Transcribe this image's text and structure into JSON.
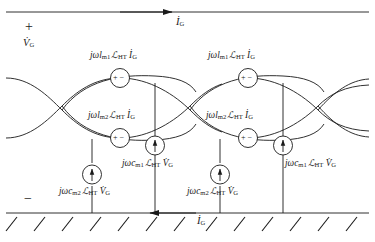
{
  "diagram": {
    "type": "circuit-schematic",
    "line_color": "#1a1a1a",
    "background": "#ffffff"
  },
  "terminals": {
    "plus_sign": "+",
    "minus_sign": "−",
    "port_voltage": "V̇",
    "port_voltage_sub": "G"
  },
  "rails": {
    "top_current_label": "İ",
    "top_current_sub": "G",
    "top_arrow_direction": "right",
    "bottom_current_label": "İ",
    "bottom_current_sub": "G",
    "bottom_arrow_direction": "left",
    "ground_hatch_count": 13
  },
  "sources": [
    {
      "id": "vsrc-l-m1-left",
      "kind": "voltage-source",
      "polarity": "+ −",
      "prefix": "jωl",
      "sub": "m1",
      "script": "ℒ",
      "script_sub": "HT",
      "quantity": "İ",
      "quantity_sub": "G",
      "label": "jωl m1 ℒ HT İ G"
    },
    {
      "id": "vsrc-l-m2-left",
      "kind": "voltage-source",
      "polarity": "+ −",
      "prefix": "jωl",
      "sub": "m2",
      "script": "ℒ",
      "script_sub": "HT",
      "quantity": "İ",
      "quantity_sub": "G",
      "label": "jωl m2 ℒ HT İ G"
    },
    {
      "id": "isrc-c-m1-left",
      "kind": "current-source",
      "arrow": "up",
      "prefix": "jωc",
      "sub": "m1",
      "script": "ℒ",
      "script_sub": "HT",
      "quantity": "V̇",
      "quantity_sub": "G",
      "label": "jωc m1 ℒ HT V̇ G"
    },
    {
      "id": "isrc-c-m2-left",
      "kind": "current-source",
      "arrow": "up",
      "prefix": "jωc",
      "sub": "m2",
      "script": "ℒ",
      "script_sub": "HT",
      "quantity": "V̇",
      "quantity_sub": "G",
      "label": "jωc m2 ℒ HT V̇ G"
    },
    {
      "id": "vsrc-l-m1-right",
      "kind": "voltage-source",
      "polarity": "+ −",
      "prefix": "jωl",
      "sub": "m1",
      "script": "ℒ",
      "script_sub": "HT",
      "quantity": "İ",
      "quantity_sub": "G",
      "label": "jωl m1 ℒ HT İ G"
    },
    {
      "id": "vsrc-l-m2-right",
      "kind": "voltage-source",
      "polarity": "+ −",
      "prefix": "jωl",
      "sub": "m2",
      "script": "ℒ",
      "script_sub": "HT",
      "quantity": "İ",
      "quantity_sub": "G",
      "label": "jωl m2 ℒ HT İ G"
    },
    {
      "id": "isrc-c-m1-right",
      "kind": "current-source",
      "arrow": "up",
      "prefix": "jωc",
      "sub": "m1",
      "script": "ℒ",
      "script_sub": "HT",
      "quantity": "V̇",
      "quantity_sub": "G",
      "label": "jωc m1 ℒ HT V̇ G"
    },
    {
      "id": "isrc-c-m2-right",
      "kind": "current-source",
      "arrow": "up",
      "prefix": "jωc",
      "sub": "m2",
      "script": "ℒ",
      "script_sub": "HT",
      "quantity": "V̇",
      "quantity_sub": "G",
      "label": "jωc m2 ℒ HT V̇ G"
    }
  ],
  "parts": {
    "jw": "jω",
    "l": "l",
    "c": "c",
    "m1": "m1",
    "m2": "m2",
    "script_L": "ℒ",
    "HT": "HT",
    "I_dot": "İ",
    "V_dot": "V̇",
    "G": "G",
    "plus": "+",
    "minus": "−"
  }
}
